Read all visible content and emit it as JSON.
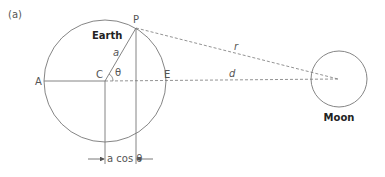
{
  "figure": {
    "panel_label": "(a)",
    "earth_label": "Earth",
    "moon_label": "Moon",
    "points": {
      "P": "P",
      "A": "A",
      "C": "C",
      "E": "E"
    },
    "radius_label": "a",
    "angle_label": "θ",
    "distance_r_label": "r",
    "distance_d_label": "d",
    "projection_label": "a cos θ"
  },
  "colors": {
    "line": "#777777",
    "text": "#555555",
    "bold_text": "#222222"
  }
}
